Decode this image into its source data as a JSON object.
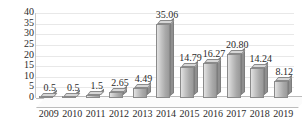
{
  "chart_data": {
    "type": "bar",
    "title": "",
    "subtitle": "",
    "xlabel": "",
    "ylabel": "",
    "categories": [
      "2009",
      "2010",
      "2011",
      "2012",
      "2013",
      "2014",
      "2015",
      "2016",
      "2017",
      "2018",
      "2019"
    ],
    "values": [
      0.5,
      0.5,
      1.5,
      2.65,
      4.49,
      35.06,
      14.79,
      16.27,
      20.8,
      14.24,
      8.12
    ],
    "data_labels": [
      "0.5",
      "0.5",
      "1.5",
      "2.65",
      "4.49",
      "35.06",
      "14.79",
      "16.27",
      "20.80",
      "14.24",
      "8.12"
    ],
    "ylim": [
      0,
      40
    ],
    "yticks": [
      0,
      5,
      10,
      15,
      20,
      25,
      30,
      35,
      40
    ],
    "ytick_labels": [
      "0",
      "5",
      "10",
      "15",
      "20",
      "25",
      "30",
      "35",
      "40"
    ],
    "grid": true,
    "grid_axis": "y",
    "legend": false,
    "legend_position": "none",
    "series": [
      {
        "name": "",
        "values": [
          0.5,
          0.5,
          1.5,
          2.65,
          4.49,
          35.06,
          14.79,
          16.27,
          20.8,
          14.24,
          8.12
        ],
        "color": "#b0b0b0"
      }
    ],
    "style": {
      "bar_face_color": "#c4c4c4",
      "bar_side_color": "#8f8f8f",
      "bar_edge_color": "#8a8a8a",
      "grid_color": "#e8e8e8",
      "axis_color": "#bdbdbd",
      "text_color": "#2b2b2b",
      "background": "#ffffff",
      "three_d": true
    }
  }
}
